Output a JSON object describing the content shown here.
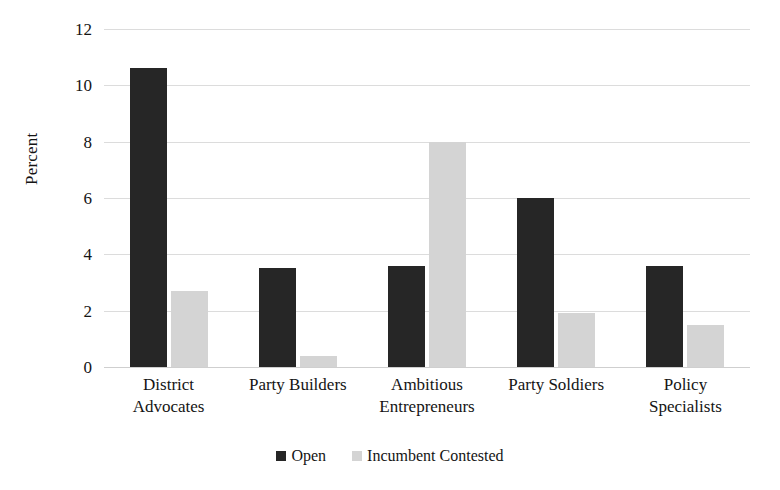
{
  "chart_data": {
    "type": "bar",
    "title": "",
    "xlabel": "",
    "ylabel": "Percent",
    "ylim": [
      0,
      12
    ],
    "yticks": [
      0,
      2,
      4,
      6,
      8,
      10,
      12
    ],
    "ytick_labels": [
      "0",
      "2",
      "4",
      "6",
      "8",
      "10",
      "12"
    ],
    "grid": true,
    "legend_position": "bottom",
    "categories": [
      "District Advocates",
      "Party Builders",
      "Ambitious Entrepreneurs",
      "Party Soldiers",
      "Policy Specialists"
    ],
    "category_lines": [
      [
        "District",
        "Advocates"
      ],
      [
        "Party Builders",
        ""
      ],
      [
        "Ambitious",
        "Entrepreneurs"
      ],
      [
        "Party Soldiers",
        ""
      ],
      [
        "Policy",
        "Specialists"
      ]
    ],
    "series": [
      {
        "name": "Open",
        "color": "#262626",
        "values": [
          10.6,
          3.5,
          3.6,
          6.0,
          3.6
        ]
      },
      {
        "name": "Incumbent Contested",
        "color": "#d4d4d4",
        "values": [
          2.7,
          0.4,
          8.0,
          1.9,
          1.5
        ]
      }
    ]
  },
  "legend": {
    "items": [
      {
        "label": "Open",
        "color": "#262626"
      },
      {
        "label": "Incumbent Contested",
        "color": "#d4d4d4"
      }
    ]
  },
  "colors": {
    "open": "#262626",
    "incumbent_contested": "#d4d4d4",
    "gridline": "#dcdcdc",
    "text": "#141414",
    "background": "#ffffff"
  }
}
